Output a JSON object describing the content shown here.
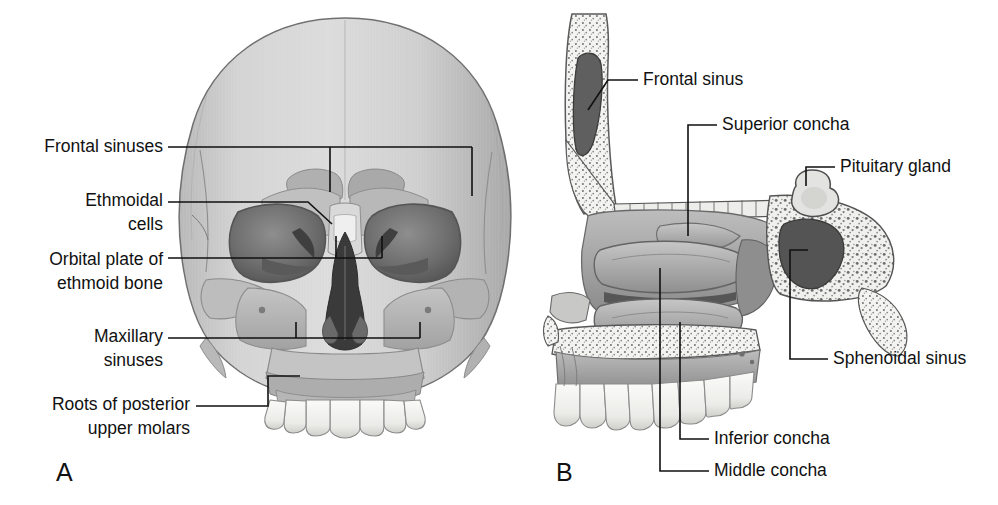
{
  "figure": {
    "background_color": "#ffffff",
    "ink_color": "#111111",
    "width": 998,
    "height": 505
  },
  "panels": [
    {
      "letter": "A",
      "view": "anterior view of skull showing paranasal sinuses",
      "letter_x": 56,
      "letter_y": 481
    },
    {
      "letter": "B",
      "view": "sagittal section of lateral nasal wall",
      "letter_x": 556,
      "letter_y": 481
    }
  ],
  "labels_panel_a": [
    {
      "id": "frontal-sinuses",
      "lines": [
        "Frontal sinuses"
      ],
      "anchor": "end",
      "text_x": 163,
      "text_y": 152
    },
    {
      "id": "ethmoidal-cells",
      "lines": [
        "Ethmoidal",
        "cells"
      ],
      "anchor": "end",
      "text_x": 163,
      "text_y": 206
    },
    {
      "id": "orbital-plate-of-ethmoid-bone",
      "lines": [
        "Orbital plate of",
        "ethmoid bone"
      ],
      "anchor": "end",
      "text_x": 163,
      "text_y": 265
    },
    {
      "id": "maxillary-sinuses",
      "lines": [
        "Maxillary",
        "sinuses"
      ],
      "anchor": "end",
      "text_x": 163,
      "text_y": 342
    },
    {
      "id": "roots-of-posterior-upper-molars",
      "lines": [
        "Roots of posterior",
        "upper molars"
      ],
      "anchor": "end",
      "text_x": 190,
      "text_y": 410
    }
  ],
  "labels_panel_b": [
    {
      "id": "frontal-sinus",
      "lines": [
        "Frontal sinus"
      ],
      "anchor": "start",
      "text_x": 643,
      "text_y": 85
    },
    {
      "id": "superior-concha",
      "lines": [
        "Superior concha"
      ],
      "anchor": "start",
      "text_x": 722,
      "text_y": 130
    },
    {
      "id": "pituitary-gland",
      "lines": [
        "Pituitary gland"
      ],
      "anchor": "start",
      "text_x": 840,
      "text_y": 172
    },
    {
      "id": "sphenoidal-sinus",
      "lines": [
        "Sphenoidal sinus"
      ],
      "anchor": "start",
      "text_x": 833,
      "text_y": 364
    },
    {
      "id": "inferior-concha",
      "lines": [
        "Inferior concha"
      ],
      "anchor": "start",
      "text_x": 714,
      "text_y": 444
    },
    {
      "id": "middle-concha",
      "lines": [
        "Middle concha"
      ],
      "anchor": "start",
      "text_x": 714,
      "text_y": 476
    }
  ],
  "palette": {
    "bone_light": "#d2d2d2",
    "bone_mid": "#b4b4b4",
    "bone_dark": "#8d8d8d",
    "cavity_dark": "#4a4a4a",
    "cavity_deep": "#2e2e2e",
    "tooth": "#f2f2f0",
    "outline": "#4f4f4f",
    "leader": "#111111"
  }
}
